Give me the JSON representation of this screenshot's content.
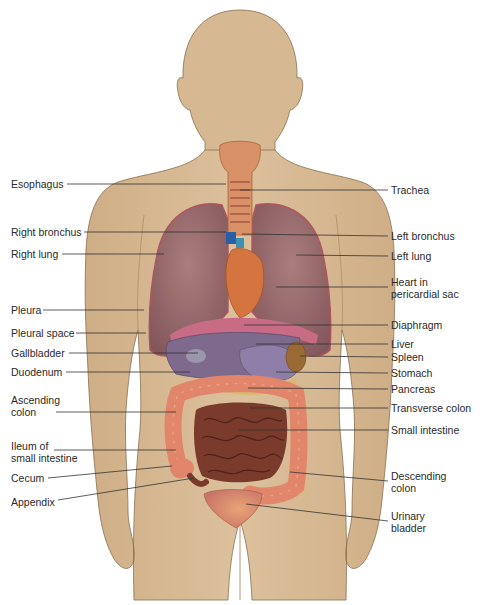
{
  "diagram": {
    "colors": {
      "skin": "#d9bc97",
      "skin_shadow": "#c9a77f",
      "outline": "#8a6e50",
      "lung": "#9a6a6e",
      "lung_dark": "#7e5259",
      "diaphragm": "#c86b85",
      "liver": "#7d6a8c",
      "stomach": "#8f7fa8",
      "spleen": "#9a6a35",
      "pancreas": "#d8b86a",
      "colon": "#e2866b",
      "small_intestine": "#7a3a2c",
      "bladder": "#d98a72",
      "heart": "#d4753f",
      "trachea": "#e0a27c",
      "leader_line": "#333333",
      "text": "#2a2a2a"
    },
    "left_labels": [
      {
        "id": "esophagus",
        "text": "Esophagus"
      },
      {
        "id": "right-bronchus",
        "text": "Right bronchus"
      },
      {
        "id": "right-lung",
        "text": "Right lung"
      },
      {
        "id": "pleura",
        "text": "Pleura"
      },
      {
        "id": "pleural-space",
        "text": "Pleural space"
      },
      {
        "id": "gallbladder",
        "text": "Gallbladder"
      },
      {
        "id": "duodenum",
        "text": "Duodenum"
      },
      {
        "id": "ascending-colon",
        "line1": "Ascending",
        "line2": "colon"
      },
      {
        "id": "ileum",
        "line1": "Ileum of",
        "line2": "small intestine"
      },
      {
        "id": "cecum",
        "text": "Cecum"
      },
      {
        "id": "appendix",
        "text": "Appendix"
      }
    ],
    "right_labels": [
      {
        "id": "trachea",
        "text": "Trachea"
      },
      {
        "id": "left-bronchus",
        "text": "Left bronchus"
      },
      {
        "id": "left-lung",
        "text": "Left lung"
      },
      {
        "id": "heart",
        "line1": "Heart in",
        "line2": "pericardial sac"
      },
      {
        "id": "diaphragm",
        "text": "Diaphragm"
      },
      {
        "id": "liver",
        "text": "Liver"
      },
      {
        "id": "spleen",
        "text": "Spleen"
      },
      {
        "id": "stomach",
        "text": "Stomach"
      },
      {
        "id": "pancreas",
        "text": "Pancreas"
      },
      {
        "id": "transverse-colon",
        "text": "Transverse colon"
      },
      {
        "id": "small-intestine",
        "text": "Small intestine"
      },
      {
        "id": "descending-colon",
        "line1": "Descending",
        "line2": "colon"
      },
      {
        "id": "urinary-bladder",
        "line1": "Urinary",
        "line2": "bladder"
      }
    ]
  }
}
